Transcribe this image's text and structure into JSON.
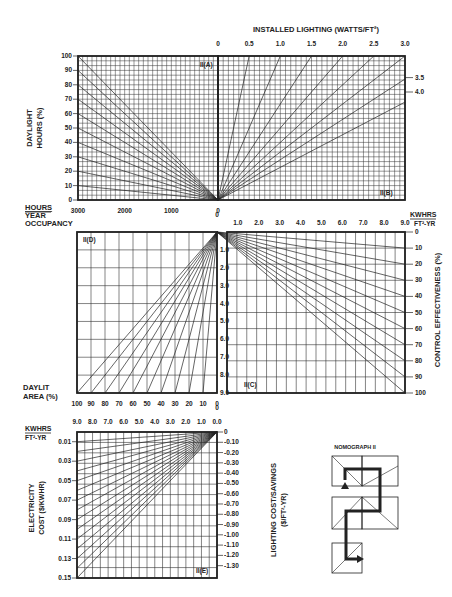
{
  "colors": {
    "ink": "#222222",
    "grid": "#333333",
    "background": "#ffffff"
  },
  "titles": {
    "installed_lighting": "INSTALLED LIGHTING (WATTS/FT²)",
    "daylight_hours_1": "DAYLIGHT",
    "daylight_hours_2": "HOURS (%)",
    "hours_year_1": "HOURS",
    "hours_year_2": "YEAR",
    "hours_year_3": "OCCUPANCY",
    "kwhrs_1": "KWHRS",
    "kwhrs_2": "FT²-YR",
    "daylit_area_1": "DAYLIT",
    "daylit_area_2": "AREA (%)",
    "control_effectiveness": "CONTROL EFFECTIVENESS (%)",
    "electricity_cost_1": "ELECTRICITY",
    "electricity_cost_2": "COST ($/KWHR)",
    "lighting_cost_1": "LIGHTING COST/SAVINGS",
    "lighting_cost_2": "($/FT²-YR)",
    "nomograph": "NOMOGRAPH II"
  },
  "quadrant_labels": {
    "A": "II(A)",
    "B": "II(B)",
    "C": "II(C)",
    "D": "II(D)",
    "E": "II(E)"
  },
  "chart_data": [
    {
      "id": "II(A)",
      "type": "line",
      "title": "Daylight hours vs annual occupancy hours",
      "xlabel": "HOURS/YEAR OCCUPANCY",
      "ylabel": "DAYLIGHT HOURS (%)",
      "x_ticks": [
        "3000",
        "2000",
        "1000",
        "0"
      ],
      "y_ticks": [
        "0",
        "10",
        "20",
        "30",
        "40",
        "50",
        "60",
        "70",
        "80",
        "90",
        "100"
      ],
      "xlim": [
        3000,
        0
      ],
      "ylim": [
        0,
        100
      ],
      "series_endpoints_pct": [
        10,
        20,
        30,
        40,
        50,
        60,
        70,
        80,
        90,
        100
      ],
      "grid": true
    },
    {
      "id": "II(B)",
      "type": "line",
      "title": "INSTALLED LIGHTING (WATTS/FT²)",
      "top_ticks": [
        "0",
        "0.5",
        "1.0",
        "1.5",
        "2.0",
        "2.5",
        "3.0"
      ],
      "right_ticks": [
        "3.5",
        "4.0"
      ],
      "series_watts": [
        0.5,
        1.0,
        1.5,
        2.0,
        2.5,
        3.0,
        3.5,
        4.0
      ],
      "grid": true
    },
    {
      "id": "II(C)",
      "type": "line",
      "title": "CONTROL EFFECTIVENESS (%)",
      "xlabel": "KWHRS/FT²-YR",
      "x_ticks": [
        "0",
        "1.0",
        "2.0",
        "3.0",
        "4.0",
        "5.0",
        "6.0",
        "7.0",
        "8.0",
        "9.0"
      ],
      "right_ticks": [
        "0",
        "10",
        "20",
        "30",
        "40",
        "50",
        "60",
        "70",
        "80",
        "90",
        "100"
      ],
      "series_pct": [
        10,
        20,
        30,
        40,
        50,
        60,
        70,
        80,
        90,
        100
      ],
      "grid": true
    },
    {
      "id": "II(D)",
      "type": "line",
      "title": "Daylit area",
      "xlabel": "DAYLIT AREA (%)",
      "x_ticks": [
        "100",
        "90",
        "80",
        "70",
        "60",
        "50",
        "40",
        "30",
        "20",
        "10",
        "0"
      ],
      "right_ticks": [
        "1.0",
        "2.0",
        "3.0",
        "4.0",
        "5.0",
        "6.0",
        "7.0",
        "8.0",
        "9.0"
      ],
      "series_pct": [
        10,
        20,
        30,
        40,
        50,
        60,
        70,
        80,
        90,
        100
      ],
      "grid": true
    },
    {
      "id": "II(E)",
      "type": "line",
      "title": "Lighting cost/savings",
      "xlabel": "KWHRS/FT²-YR",
      "x_ticks": [
        "9.0",
        "8.0",
        "7.0",
        "6.0",
        "5.0",
        "4.0",
        "3.0",
        "2.0",
        "1.0",
        "0.0"
      ],
      "ylabel": "ELECTRICITY COST ($/KWHR)",
      "y_ticks": [
        "0.01",
        "0.03",
        "0.05",
        "0.07",
        "0.09",
        "0.11",
        "0.13",
        "0.15"
      ],
      "right_label": "LIGHTING COST/SAVINGS ($/FT²-YR)",
      "right_ticks": [
        "0",
        "0.10",
        "0.20",
        "0.30",
        "0.40",
        "0.50",
        "0.60",
        "0.70",
        "0.80",
        "0.90",
        "1.00",
        "1.10",
        "1.20",
        "1.30"
      ],
      "series_cost": [
        0.01,
        0.02,
        0.03,
        0.04,
        0.05,
        0.06,
        0.07,
        0.08,
        0.09,
        0.1,
        0.11,
        0.12,
        0.13,
        0.14,
        0.15
      ],
      "grid": true
    }
  ]
}
